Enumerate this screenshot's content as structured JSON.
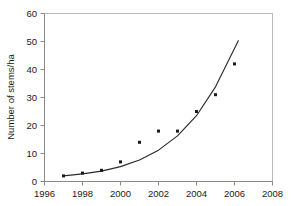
{
  "chart_data": {
    "type": "scatter",
    "title": "",
    "subtitle": "",
    "xlabel": "",
    "ylabel": "Number of stems/ha",
    "xlim": [
      1996,
      2008
    ],
    "ylim": [
      0,
      60
    ],
    "xticks": [
      1996,
      1998,
      2000,
      2002,
      2004,
      2006,
      2008
    ],
    "xtick_labels": [
      "1996",
      "1998",
      "2000",
      "2002",
      "2004",
      "2006",
      "2008"
    ],
    "yticks": [
      0,
      10,
      20,
      30,
      40,
      50,
      60
    ],
    "ytick_labels": [
      "0",
      "10",
      "20",
      "30",
      "40",
      "50",
      "60"
    ],
    "grid": false,
    "legend": false,
    "legend_position": "none",
    "x": [
      1997,
      1998,
      1999,
      2000,
      2001,
      2002,
      2003,
      2004,
      2005,
      2006
    ],
    "values": [
      2,
      3,
      4,
      7,
      14,
      18,
      18,
      25,
      31,
      42
    ],
    "series": [
      {
        "name": "Number of stems/ha",
        "type": "scatter",
        "marker": "square",
        "color": "#1a1a1a",
        "x": [
          1997,
          1998,
          1999,
          2000,
          2001,
          2002,
          2003,
          2004,
          2005,
          2006
        ],
        "values": [
          2,
          3,
          4,
          7,
          14,
          18,
          18,
          25,
          31,
          42
        ]
      },
      {
        "name": "fitted exponential trend",
        "type": "line",
        "color": "#2b2b2b",
        "x": [
          1997.0,
          1998.0,
          1999.0,
          2000.0,
          2001.0,
          2002.0,
          2003.0,
          2004.0,
          2005.0,
          2006.2
        ],
        "values": [
          2.0,
          2.7,
          3.7,
          5.3,
          7.7,
          11.2,
          16.3,
          23.5,
          33.8,
          50.3
        ]
      }
    ],
    "annotations": []
  },
  "axes": {
    "y_axis_title": "Number of stems/ha",
    "x_axis_title": ""
  },
  "colors": {
    "marker": "#1a1a1a",
    "curve": "#2b2b2b",
    "frame": "#b8b8b8",
    "axis": "#8a8a8a",
    "text": "#1a1a1a",
    "background": "#ffffff"
  }
}
